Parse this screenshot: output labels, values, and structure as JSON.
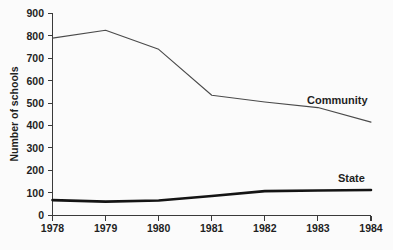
{
  "chart_data": {
    "type": "line",
    "title": "",
    "subtitle": "",
    "xlabel": "",
    "ylabel": "Number of schools",
    "x": [
      1978,
      1979,
      1980,
      1981,
      1982,
      1983,
      1984
    ],
    "categories": [
      "1978",
      "1979",
      "1980",
      "1981",
      "1982",
      "1983",
      "1984"
    ],
    "xlim": [
      1978,
      1984
    ],
    "ylim": [
      0,
      900
    ],
    "yticks": [
      0,
      100,
      200,
      300,
      400,
      500,
      600,
      700,
      800,
      900
    ],
    "ytick_labels": [
      "0",
      "100",
      "200",
      "300",
      "400",
      "500",
      "600",
      "700",
      "800",
      "900"
    ],
    "xticks": [
      1978,
      1979,
      1980,
      1981,
      1982,
      1983,
      1984
    ],
    "xtick_labels": [
      "1978",
      "1979",
      "1980",
      "1981",
      "1982",
      "1983",
      "1984"
    ],
    "grid": false,
    "legend_position": "inline-end-of-line",
    "series": [
      {
        "name": "Community",
        "label": "Community",
        "color": "#4a4a4a",
        "line_width": "thin",
        "values": [
          790,
          825,
          740,
          535,
          505,
          480,
          415
        ]
      },
      {
        "name": "State",
        "label": "State",
        "color": "#141414",
        "line_width": "thick",
        "values": [
          67,
          60,
          65,
          85,
          107,
          110,
          112
        ]
      }
    ],
    "annotations": [
      {
        "text": "Community",
        "near_series": "Community",
        "at_x": 1983
      },
      {
        "text": "State",
        "near_series": "State",
        "at_x": 1983.6
      }
    ]
  },
  "colors": {
    "background": "#fbfbfb",
    "axis": "#3a3a3a",
    "text": "#1f1f1f",
    "community": "#4a4a4a",
    "state": "#141414"
  }
}
